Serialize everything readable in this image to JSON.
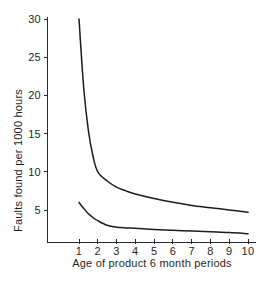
{
  "chart_data": {
    "type": "line",
    "title": "",
    "xlabel": "Age of product 6 month periods",
    "ylabel": "Faults found per 1000 hours",
    "xlim": [
      0.45,
      10.6
    ],
    "ylim": [
      0.65,
      31.2
    ],
    "grid": false,
    "legend": "none",
    "x_ticks": [
      {
        "value": 1,
        "label": "1"
      },
      {
        "value": 2,
        "label": "2"
      },
      {
        "value": 3,
        "label": "3"
      },
      {
        "value": 4,
        "label": "4"
      },
      {
        "value": 5,
        "label": "5"
      },
      {
        "value": 6,
        "label": "6"
      },
      {
        "value": 7,
        "label": "7"
      },
      {
        "value": 8,
        "label": "8"
      },
      {
        "value": 9,
        "label": "9"
      },
      {
        "value": 10,
        "label": "10"
      }
    ],
    "y_ticks": [
      {
        "value": 5,
        "label": "5"
      },
      {
        "value": 10,
        "label": "10"
      },
      {
        "value": 15,
        "label": "15"
      },
      {
        "value": 20,
        "label": "20"
      },
      {
        "value": 25,
        "label": "25"
      },
      {
        "value": 30,
        "label": "30"
      }
    ],
    "x": [
      1,
      1.25,
      1.5,
      1.75,
      2,
      2.5,
      3,
      3.5,
      4,
      5,
      6,
      7,
      8,
      9,
      10
    ],
    "series": [
      {
        "name": "upper-curve",
        "color": "#1c1c1c",
        "values": [
          30.0,
          21.0,
          15.4,
          12.0,
          10.0,
          8.8,
          8.0,
          7.5,
          7.1,
          6.5,
          6.0,
          5.6,
          5.3,
          5.0,
          4.7
        ]
      },
      {
        "name": "lower-curve",
        "color": "#1c1c1c",
        "values": [
          6.0,
          5.2,
          4.5,
          4.0,
          3.6,
          3.0,
          2.75,
          2.65,
          2.6,
          2.45,
          2.35,
          2.25,
          2.15,
          2.05,
          1.9
        ]
      }
    ]
  }
}
